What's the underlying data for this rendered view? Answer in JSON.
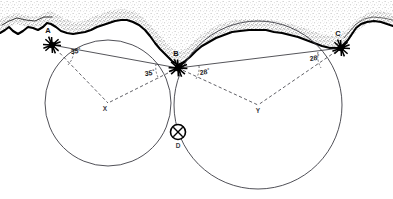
{
  "figure": {
    "width": 393,
    "height": 199,
    "background_color": "#ffffff",
    "ink_color": "#000000"
  },
  "stations": [
    {
      "id": "A",
      "label": "A",
      "x": 52,
      "y": 45,
      "label_x": 48,
      "label_y": 33,
      "symbol": "survey-station-star"
    },
    {
      "id": "B",
      "label": "B",
      "x": 178,
      "y": 68,
      "label_x": 176,
      "label_y": 56,
      "symbol": "survey-station-star"
    },
    {
      "id": "C",
      "label": "C",
      "x": 341,
      "y": 48,
      "label_x": 338,
      "label_y": 36,
      "symbol": "survey-station-star"
    }
  ],
  "vertices": [
    {
      "id": "X",
      "label": "X",
      "x": 108,
      "y": 103,
      "label_x": 105,
      "label_y": 111,
      "role": "left-circle-centre-construction"
    },
    {
      "id": "Y",
      "label": "Y",
      "x": 258,
      "y": 105,
      "label_x": 255,
      "label_y": 113,
      "role": "right-circle-centre-construction"
    },
    {
      "id": "D",
      "label": "D",
      "x": 178,
      "y": 132,
      "label_x": 176,
      "label_y": 146,
      "role": "observer-ship-position"
    }
  ],
  "angles": [
    {
      "id": "angle-at-A",
      "value": "35",
      "unit": "°",
      "at_station": "A",
      "label_x": 71,
      "label_y": 54
    },
    {
      "id": "angle-at-B-left",
      "value": "35",
      "unit": "°",
      "at_station": "B",
      "label_x": 148,
      "label_y": 75
    },
    {
      "id": "angle-at-B-right",
      "value": "28",
      "unit": "°",
      "at_station": "B",
      "label_x": 201,
      "label_y": 74
    },
    {
      "id": "angle-at-C",
      "value": "28",
      "unit": "°",
      "at_station": "C",
      "label_x": 312,
      "label_y": 60
    }
  ],
  "circles": [
    {
      "id": "left-position-circle",
      "centre_x": 108,
      "centre_y": 103,
      "radius": 63,
      "passes_through": [
        "A",
        "B",
        "D"
      ]
    },
    {
      "id": "right-position-circle",
      "centre_x": 258,
      "centre_y": 105,
      "radius": 84,
      "passes_through": [
        "B",
        "C",
        "D"
      ]
    }
  ],
  "sight_lines": [
    {
      "id": "baseline-A-B",
      "from": "A",
      "to": "B"
    },
    {
      "id": "baseline-B-C",
      "from": "B",
      "to": "C"
    }
  ],
  "construction_lines": [
    {
      "id": "A-to-X",
      "from": "A",
      "to": "X"
    },
    {
      "id": "B-to-X",
      "from": "B",
      "to": "X"
    },
    {
      "id": "B-to-Y",
      "from": "B",
      "to": "Y"
    },
    {
      "id": "C-to-Y",
      "from": "C",
      "to": "Y"
    }
  ],
  "ship": {
    "id": "ship-position-symbol",
    "label": "D",
    "x": 178,
    "y": 132,
    "radius": 7.5,
    "style": "circle-with-cross"
  },
  "coastline": {
    "id": "coastline",
    "description": "stippled shoreline running left to right across the top of the chart",
    "stroke_color": "#000000",
    "stipple_color": "#8a8a8a"
  }
}
